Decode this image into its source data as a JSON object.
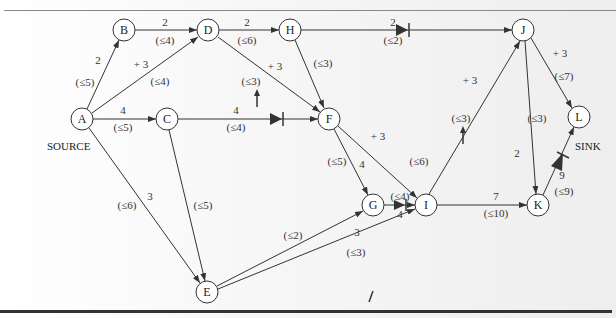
{
  "diagram": {
    "source_label": "SOURCE",
    "sink_label": "SINK",
    "nodes": [
      {
        "id": "A",
        "x": 82,
        "y": 119
      },
      {
        "id": "B",
        "x": 124,
        "y": 30
      },
      {
        "id": "C",
        "x": 167,
        "y": 119
      },
      {
        "id": "D",
        "x": 208,
        "y": 30
      },
      {
        "id": "H",
        "x": 290,
        "y": 30
      },
      {
        "id": "F",
        "x": 329,
        "y": 119
      },
      {
        "id": "J",
        "x": 523,
        "y": 30
      },
      {
        "id": "L",
        "x": 579,
        "y": 117
      },
      {
        "id": "G",
        "x": 373,
        "y": 205
      },
      {
        "id": "I",
        "x": 426,
        "y": 205
      },
      {
        "id": "K",
        "x": 538,
        "y": 205
      },
      {
        "id": "E",
        "x": 207,
        "y": 292
      }
    ],
    "edges": [
      {
        "from": "A",
        "to": "B",
        "flow": "2",
        "capacity": "(≤5)"
      },
      {
        "from": "B",
        "to": "D",
        "flow": "2",
        "capacity": "(≤4)"
      },
      {
        "from": "A",
        "to": "D",
        "flow": "+ 3",
        "capacity": "(≤4)"
      },
      {
        "from": "D",
        "to": "H",
        "flow": "2",
        "capacity": "(≤6)"
      },
      {
        "from": "D",
        "to": "F",
        "flow": "+ 3",
        "capacity": "(≤3)",
        "augment_arrow": true
      },
      {
        "from": "H",
        "to": "J",
        "flow": "2",
        "capacity": "(≤2)",
        "saturated": true
      },
      {
        "from": "H",
        "to": "F",
        "flow": "",
        "capacity": "(≤3)"
      },
      {
        "from": "A",
        "to": "C",
        "flow": "4",
        "capacity": "(≤5)"
      },
      {
        "from": "C",
        "to": "F",
        "flow": "4",
        "capacity": "(≤4)",
        "saturated": true
      },
      {
        "from": "A",
        "to": "E",
        "flow": "3",
        "capacity": "(≤6)"
      },
      {
        "from": "C",
        "to": "E",
        "flow": "",
        "capacity": "(≤5)"
      },
      {
        "from": "F",
        "to": "G",
        "flow": "4",
        "capacity": "(≤5)"
      },
      {
        "from": "F",
        "to": "I",
        "flow": "+ 3",
        "capacity": "(≤6)"
      },
      {
        "from": "G",
        "to": "I",
        "flow": "4",
        "capacity": "(≤4)",
        "saturated": true
      },
      {
        "from": "E",
        "to": "G",
        "flow": "",
        "capacity": "(≤2)"
      },
      {
        "from": "E",
        "to": "I",
        "flow": "3",
        "capacity": "(≤3)",
        "saturated": true
      },
      {
        "from": "I",
        "to": "J",
        "flow": "+ 3",
        "capacity": "(≤3)",
        "augment_arrow": true
      },
      {
        "from": "I",
        "to": "K",
        "flow": "7",
        "capacity": "(≤10)"
      },
      {
        "from": "J",
        "to": "K",
        "flow": "2",
        "capacity": "(≤3)"
      },
      {
        "from": "J",
        "to": "L",
        "flow": "+ 3",
        "capacity": "(≤7)"
      },
      {
        "from": "K",
        "to": "L",
        "flow": "9",
        "capacity": "(≤9)",
        "saturated": true
      }
    ]
  },
  "labels": {
    "AB_flow": "2",
    "AB_cap": "(≤5)",
    "BD_flow": "2",
    "BD_cap": "(≤4)",
    "AD_flow": "+ 3",
    "AD_cap": "(≤4)",
    "DH_flow": "2",
    "DH_cap": "(≤6)",
    "DF_flow": "+ 3",
    "DF_cap": "(≤3)",
    "HJ_flow": "2",
    "HJ_cap": "(≤2)",
    "HF_cap": "(≤3)",
    "AC_flow": "4",
    "AC_cap": "(≤5)",
    "CF_flow": "4",
    "CF_cap": "(≤4)",
    "AE_flow": "3",
    "AE_cap": "(≤6)",
    "CE_cap": "(≤5)",
    "FG_flow": "4",
    "FG_cap": "(≤5)",
    "FI_flow": "+ 3",
    "FI_cap": "(≤6)",
    "GI_flow": "4",
    "GI_cap": "(≤4)",
    "EG_cap": "(≤2)",
    "EI_flow": "3",
    "EI_cap": "(≤3)",
    "IJ_flow": "+ 3",
    "IJ_cap": "(≤3)",
    "IK_flow": "7",
    "IK_cap": "(≤10)",
    "JK_flow": "2",
    "JK_cap": "(≤3)",
    "JL_flow": "+ 3",
    "JL_cap": "(≤7)",
    "KL_flow": "9",
    "KL_cap": "(≤9)"
  },
  "node_labels": {
    "A": "A",
    "B": "B",
    "C": "C",
    "D": "D",
    "E": "E",
    "F": "F",
    "G": "G",
    "H": "H",
    "I": "I",
    "J": "J",
    "K": "K",
    "L": "L"
  }
}
